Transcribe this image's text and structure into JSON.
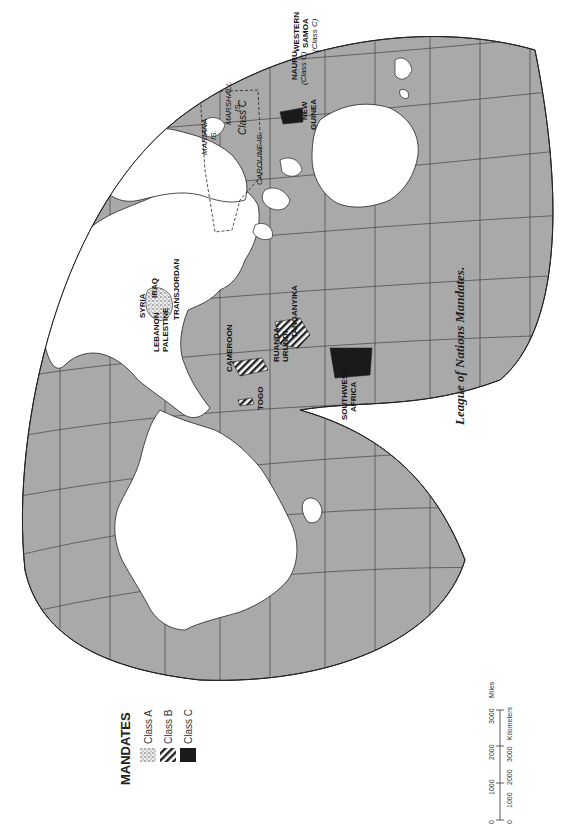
{
  "title": "League of Nations Mandates.",
  "colors": {
    "ocean": "#a9a9a9",
    "land": "#ffffff",
    "border": "#222222",
    "class_c": "#1a1a1a"
  },
  "legend": {
    "title": "MANDATES",
    "items": [
      {
        "label": "Class A",
        "pattern": "stipple"
      },
      {
        "label": "Class B",
        "pattern": "hatch"
      },
      {
        "label": "Class C",
        "pattern": "solid"
      }
    ]
  },
  "scale": {
    "miles_label": "Miles",
    "km_label": "Kilometers",
    "miles_ticks": [
      "0",
      "1000",
      "2000",
      "3000"
    ],
    "km_ticks": [
      "0",
      "1000",
      "2000",
      "3000"
    ]
  },
  "labels": {
    "syria": "SYRIA",
    "iraq": "IRAQ",
    "transjordan": "TRANSJORDAN",
    "lebanon": "LEBANON",
    "palestine": "PALESTINE",
    "cameroon": "CAMEROON",
    "togo": "TOGO",
    "ruanda": "RUANDA-",
    "urundi": "URUNDI",
    "tanganyika": "TANGANYIKA",
    "southwest1": "SOUTHWEST",
    "southwest2": "AFRICA",
    "mariana1": "MARIANA",
    "mariana2": "IS.",
    "marshall1": "MARSHALL",
    "marshall2": "IS.",
    "classc_pacific": "Class C",
    "caroline": "CAROLINE IS.",
    "newguinea1": "NEW",
    "newguinea2": "GUINEA",
    "nauru1": "NAURU",
    "nauru2": "(Class C)",
    "samoa1": "WESTERN",
    "samoa2": "SAMOA",
    "samoa3": "(Class C)"
  }
}
